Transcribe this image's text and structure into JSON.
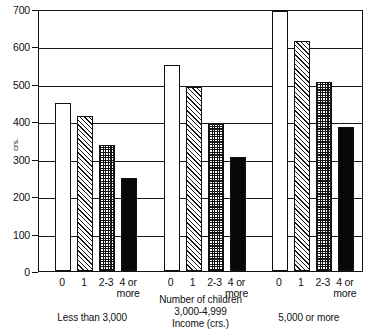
{
  "chart_data": {
    "type": "bar",
    "title": "",
    "xlabel": "Number of children",
    "ylabel": "crs.",
    "axis_caption_line1": "Number of children",
    "axis_caption_line3": "Income (crs.)",
    "ylim": [
      0,
      700
    ],
    "ytick_values": [
      0,
      100,
      200,
      300,
      400,
      500,
      600,
      700
    ],
    "ytick_labels": [
      "0",
      "100",
      "200",
      "300",
      "400",
      "500",
      "600",
      "700"
    ],
    "grid": true,
    "legend_position": "none",
    "categories": [
      "0",
      "1",
      "2-3",
      "4 or more"
    ],
    "category_labels": [
      {
        "line1": "0",
        "line2": ""
      },
      {
        "line1": "1",
        "line2": ""
      },
      {
        "line1": "2-3",
        "line2": ""
      },
      {
        "line1": "4 or",
        "line2": "more"
      }
    ],
    "groups": [
      {
        "name": "Less than 3,000",
        "caption_line1": "Less than 3,000",
        "caption_line2": "",
        "values": [
          450,
          415,
          337,
          249
        ]
      },
      {
        "name": "3,000-4,999",
        "caption_line1": "3,000-4,999",
        "caption_line2": "",
        "values": [
          551,
          492,
          393,
          305
        ]
      },
      {
        "name": "5,000 or more",
        "caption_line1": "5,000 or more",
        "caption_line2": "",
        "values": [
          695,
          615,
          505,
          385
        ]
      }
    ],
    "bar_fills": [
      "plain",
      "hatch",
      "check",
      "solid"
    ],
    "colors": {
      "axis": "#111111",
      "grid": "#1a1a1a",
      "bar_outline": "#111111",
      "bar_plain": "#ffffff",
      "bar_hatch": "#1a1a1a",
      "bar_check": "#141414",
      "bar_solid": "#080808",
      "background": "#ffffff"
    },
    "ghost_text": ""
  }
}
